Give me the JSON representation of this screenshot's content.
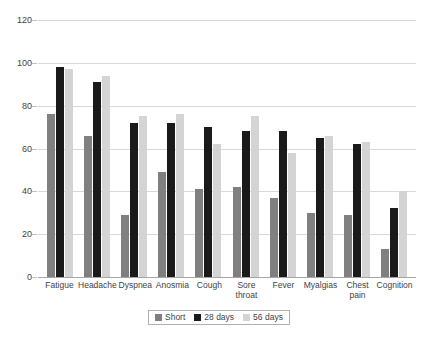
{
  "chart_data": {
    "type": "bar",
    "title": "",
    "subtitle": "",
    "xlabel": "",
    "ylabel": "",
    "ylim": [
      0,
      120
    ],
    "yticks": [
      0,
      20,
      40,
      60,
      80,
      100,
      120
    ],
    "grid": true,
    "legend_position": "bottom",
    "categories": [
      "Fatigue",
      "Headache",
      "Dyspnea",
      "Anosmia",
      "Cough",
      "Sore throat",
      "Fever",
      "Myalgias",
      "Chest pain",
      "Cognition"
    ],
    "series": [
      {
        "name": "Short",
        "color": "#808080",
        "values": [
          76,
          66,
          29,
          49,
          41,
          42,
          37,
          30,
          29,
          13
        ]
      },
      {
        "name": "28 days",
        "color": "#1a1a1a",
        "values": [
          98,
          91,
          72,
          72,
          70,
          68,
          68,
          65,
          62,
          32
        ]
      },
      {
        "name": "56 days",
        "color": "#d4d4d4",
        "values": [
          97,
          94,
          75,
          76,
          62,
          75,
          58,
          66,
          63,
          40
        ]
      }
    ]
  },
  "legend": {
    "items": [
      {
        "label": "Short",
        "color": "#808080"
      },
      {
        "label": "28 days",
        "color": "#1a1a1a"
      },
      {
        "label": "56 days",
        "color": "#d4d4d4"
      }
    ]
  }
}
